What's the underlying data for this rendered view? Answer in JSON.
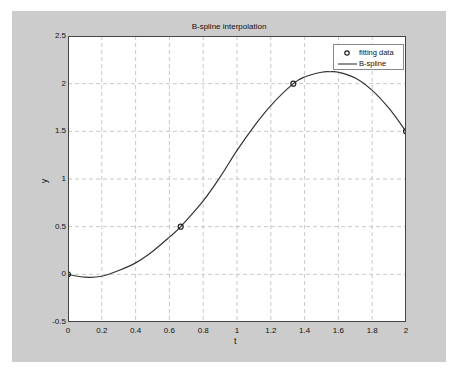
{
  "chart_data": {
    "type": "line",
    "title": "B-spline interpolation",
    "xlabel": "t",
    "ylabel": "y",
    "xlim": [
      0,
      2
    ],
    "ylim": [
      -0.5,
      2.5
    ],
    "grid": true,
    "legend_position": "upper right",
    "x_ticks": [
      "0",
      "0.2",
      "0.4",
      "0.6",
      "0.8",
      "1",
      "1.2",
      "1.4",
      "1.6",
      "1.8",
      "2"
    ],
    "y_ticks": [
      "-0.5",
      "0",
      "0.5",
      "1",
      "1.5",
      "2",
      "2.5"
    ],
    "series": [
      {
        "name": "fitting data",
        "style": "markers-circle",
        "x": [
          0,
          0.6667,
          1.3333,
          2
        ],
        "y": [
          0,
          0.5,
          2,
          1.5
        ]
      },
      {
        "name": "B-spline",
        "style": "line",
        "x": [
          0,
          0.1,
          0.2,
          0.3,
          0.4,
          0.5,
          0.6,
          0.6667,
          0.8,
          0.9,
          1.0,
          1.1,
          1.2,
          1.3333,
          1.4,
          1.5,
          1.55,
          1.6,
          1.7,
          1.8,
          1.9,
          2.0
        ],
        "y": [
          0,
          -0.03,
          -0.02,
          0.04,
          0.12,
          0.24,
          0.39,
          0.5,
          0.77,
          1.02,
          1.3,
          1.55,
          1.77,
          2.0,
          2.07,
          2.12,
          2.125,
          2.12,
          2.06,
          1.93,
          1.74,
          1.5
        ]
      }
    ]
  },
  "colors": {
    "figure_bg": "#cccccc",
    "axes_bg": "#ffffff",
    "line": "#333333",
    "grid": "#bbbbbb"
  }
}
